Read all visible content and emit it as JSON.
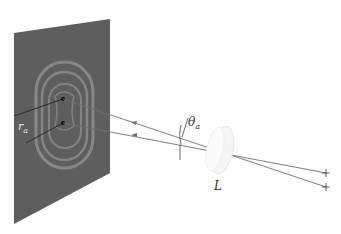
{
  "diagram": {
    "title": "",
    "labels": {
      "ring_radius": "r",
      "ring_radius_sub": "a",
      "angle": "θ",
      "angle_sub": "a",
      "lens": "L"
    },
    "colors": {
      "screen": "#5e5e5e",
      "ring": "#8f8f8f",
      "ray": "#6e6e6e",
      "lens": "#f4f4f4",
      "background": "#ffffff"
    },
    "elements": [
      {
        "id": "screen",
        "type": "observation-screen"
      },
      {
        "id": "ring-pattern",
        "type": "interference-rings",
        "count": 3
      },
      {
        "id": "image-point-1",
        "type": "image-point"
      },
      {
        "id": "image-point-2",
        "type": "image-point"
      },
      {
        "id": "lens",
        "type": "lens",
        "label": "L"
      },
      {
        "id": "source-1",
        "type": "point-source"
      },
      {
        "id": "source-2",
        "type": "point-source"
      }
    ]
  }
}
